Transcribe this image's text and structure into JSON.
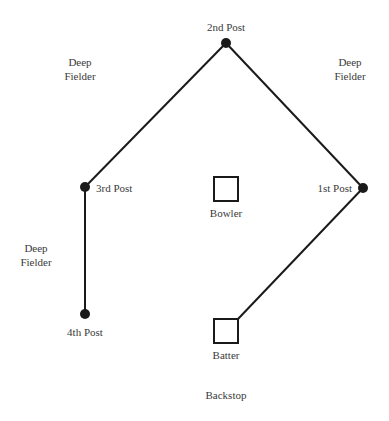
{
  "diagram": {
    "colors": {
      "line": "#1a1a1a",
      "text": "#3a3a3a",
      "background": "#ffffff"
    },
    "posts": [
      {
        "id": "post-2",
        "label": "2nd Post",
        "x": 226,
        "y": 43
      },
      {
        "id": "post-3",
        "label": "3rd Post",
        "x": 85,
        "y": 187
      },
      {
        "id": "post-1",
        "label": "1st Post",
        "x": 363,
        "y": 188
      },
      {
        "id": "post-4",
        "label": "4th Post",
        "x": 85,
        "y": 314
      }
    ],
    "positions": {
      "bowler": {
        "label": "Bowler"
      },
      "batter": {
        "label": "Batter"
      },
      "backstop": {
        "label": "Backstop"
      },
      "deep_fielder_left_top": {
        "line1": "Deep",
        "line2": "Fielder"
      },
      "deep_fielder_right_top": {
        "line1": "Deep",
        "line2": "Fielder"
      },
      "deep_fielder_left_mid": {
        "line1": "Deep",
        "line2": "Fielder"
      }
    }
  }
}
